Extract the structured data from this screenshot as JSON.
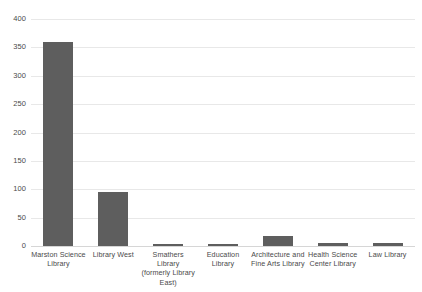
{
  "chart_data": {
    "type": "bar",
    "title": "",
    "subtitle": "",
    "xlabel": "",
    "ylabel": "",
    "ylim": [
      0,
      400
    ],
    "ytick_values": [
      0,
      50,
      100,
      150,
      200,
      250,
      300,
      350,
      400
    ],
    "ytick_labels": [
      "0",
      "50",
      "100",
      "150",
      "200",
      "250",
      "300",
      "350",
      "400"
    ],
    "grid": true,
    "legend": false,
    "legend_position": "none",
    "bar_color": "#5e5e5e",
    "gridline_color": "#e8e8e8",
    "categories": [
      "Marston Science Library",
      "Library West",
      "Smathers Library (formerly Library East)",
      "Education Library",
      "Architecture and Fine Arts Library",
      "Health Science Center Library",
      "Law Library"
    ],
    "category_lines": [
      [
        "Marston Science",
        "Library"
      ],
      [
        "Library West"
      ],
      [
        "Smathers Library",
        "(formerly Library",
        "East)"
      ],
      [
        "Education Library"
      ],
      [
        "Architecture and",
        "Fine Arts Library"
      ],
      [
        "Health Science",
        "Center Library"
      ],
      [
        "Law Library"
      ]
    ],
    "values": [
      360,
      96,
      4,
      3,
      18,
      6,
      5
    ]
  }
}
